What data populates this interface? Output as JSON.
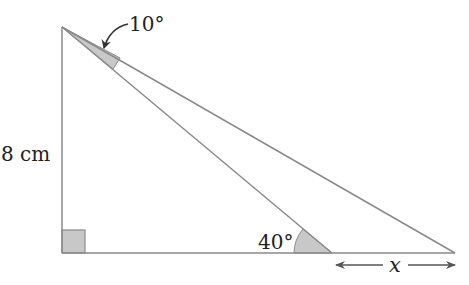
{
  "diagram": {
    "type": "right triangle geometry problem",
    "labels": {
      "side_left": "8 cm",
      "angle_top": "10°",
      "angle_bottom": "40°",
      "unknown": "x"
    },
    "colors": {
      "line": "#8a8a8a",
      "shade": "#c8c8c8",
      "text": "#222222"
    }
  }
}
